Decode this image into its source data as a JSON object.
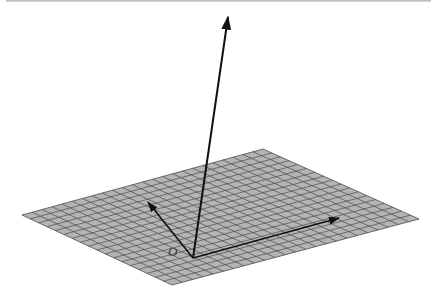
{
  "diagram": {
    "title": "",
    "origin_label": "O",
    "colors": {
      "plane_fill": "#b4b4b4",
      "grid_line": "#4a4a4a",
      "vector": "#111111",
      "top_rule": "#c0c0c0"
    },
    "plane": {
      "corners": {
        "left": [
          22,
          215
        ],
        "top": [
          263,
          149
        ],
        "right": [
          419,
          219
        ],
        "bottom": [
          172,
          285
        ]
      },
      "grid_cells_long": 24,
      "grid_cells_short": 18
    },
    "origin": [
      193,
      258
    ],
    "origin_label_pos": [
      168,
      244
    ],
    "vectors": [
      {
        "name": "normal-vector",
        "tip": [
          228,
          17
        ]
      },
      {
        "name": "in-plane-vector-left",
        "tip": [
          148,
          202
        ]
      },
      {
        "name": "in-plane-vector-right",
        "tip": [
          339,
          218
        ]
      }
    ]
  }
}
